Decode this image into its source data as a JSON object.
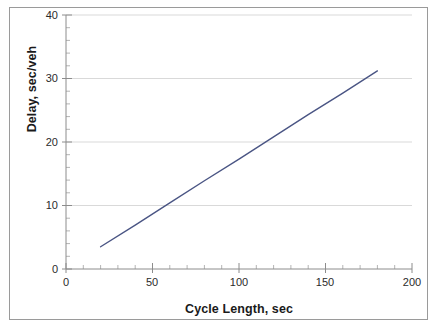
{
  "chart_data": {
    "type": "line",
    "title": "",
    "subtitle": "",
    "xlabel": "Cycle Length, sec",
    "ylabel": "Delay, sec/veh",
    "xlim": [
      0,
      200
    ],
    "ylim": [
      0,
      40
    ],
    "xticks": [
      0,
      50,
      100,
      150,
      200
    ],
    "yticks": [
      0,
      10,
      20,
      30,
      40
    ],
    "xtick_labels": [
      "0",
      "50",
      "100",
      "150",
      "200"
    ],
    "ytick_labels": [
      "0",
      "10",
      "20",
      "30",
      "40"
    ],
    "x_minor_tick_interval": 10,
    "y_minor_tick_interval": 2,
    "grid": {
      "horizontal": true,
      "vertical": false,
      "color": "#d9d9d9"
    },
    "legend": {
      "visible": false,
      "position": "none",
      "entries": []
    },
    "annotations": [],
    "series": [
      {
        "name": "Delay vs Cycle Length",
        "color": "#4a5584",
        "line_width": 1.4,
        "markers": false,
        "x": [
          20,
          40,
          60,
          80,
          100,
          120,
          140,
          160,
          180
        ],
        "y": [
          3.5,
          6.9,
          10.4,
          13.9,
          17.3,
          20.8,
          24.3,
          27.7,
          31.2
        ]
      }
    ]
  },
  "figure": {
    "background_color": "#ffffff",
    "border_color": "#9a9a9a",
    "axis_color": "#808080",
    "tick_color": "#9a9a9a",
    "text_color": "#1a1a1a"
  }
}
